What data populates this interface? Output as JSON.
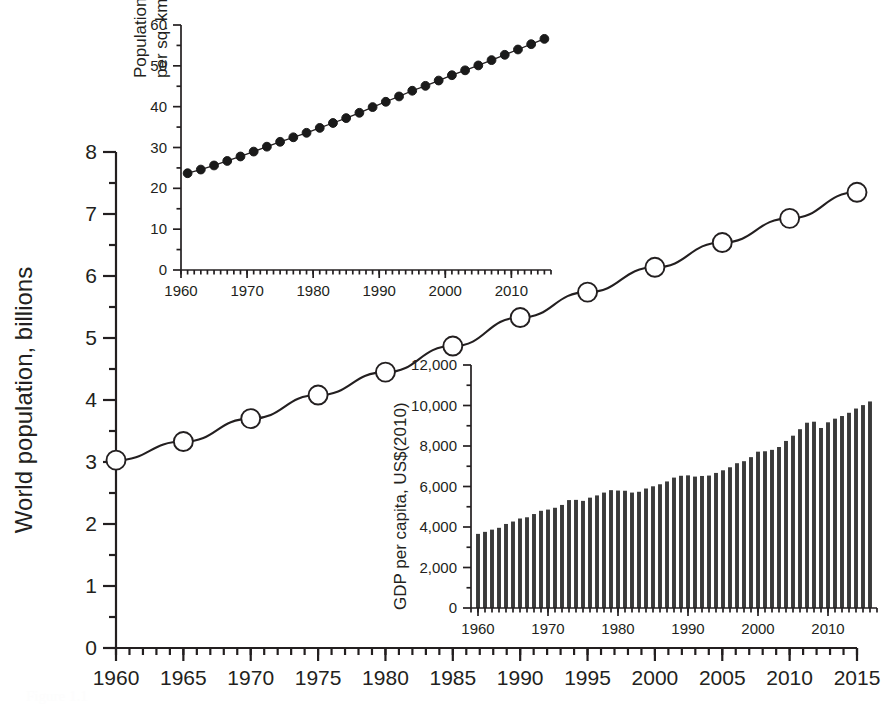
{
  "figure": {
    "background_color": "#ffffff",
    "ink_color": "#231f20",
    "width": 894,
    "height": 710,
    "caption_ghost": "Figure 1.1"
  },
  "chart_data": [
    {
      "id": "main-population",
      "type": "line",
      "title": "",
      "xlabel": "",
      "ylabel": "World population, billions",
      "xlim": [
        1960,
        2015
      ],
      "ylim": [
        0,
        8
      ],
      "grid": false,
      "legend": "none",
      "marker": "open-circle",
      "xticks": [
        1960,
        1965,
        1970,
        1975,
        1980,
        1985,
        1990,
        1995,
        2000,
        2005,
        2010,
        2015
      ],
      "xticklabels": [
        "1960",
        "1965",
        "1970",
        "1975",
        "1980",
        "1985",
        "1990",
        "1995",
        "2000",
        "2005",
        "2010",
        "2015"
      ],
      "yticks": [
        0,
        1,
        2,
        3,
        4,
        5,
        6,
        7,
        8
      ],
      "yticklabels": [
        "0",
        "1",
        "2",
        "3",
        "4",
        "5",
        "6",
        "7",
        "8"
      ],
      "x_minor_per_major": 5,
      "y_minor_per_major": 2,
      "x": [
        1960,
        1965,
        1970,
        1975,
        1980,
        1985,
        1990,
        1995,
        2000,
        2005,
        2010,
        2015
      ],
      "values": [
        3.03,
        3.33,
        3.7,
        4.08,
        4.45,
        4.87,
        5.33,
        5.74,
        6.14,
        6.54,
        6.93,
        7.35
      ]
    },
    {
      "id": "inset-population-density",
      "type": "line",
      "title": "",
      "xlabel": "",
      "ylabel": "Population density (people per sq. km of land area)",
      "xlim": [
        1960,
        2016
      ],
      "ylim": [
        0,
        60
      ],
      "grid": false,
      "legend": "none",
      "marker": "filled-circle",
      "xticks": [
        1960,
        1970,
        1980,
        1990,
        2000,
        2010
      ],
      "xticklabels": [
        "1960",
        "1970",
        "1980",
        "1990",
        "2000",
        "2010"
      ],
      "yticks": [
        0,
        10,
        20,
        30,
        40,
        50,
        60
      ],
      "yticklabels": [
        "0",
        "10",
        "20",
        "30",
        "40",
        "50",
        "60"
      ],
      "x_minor_per_major": 10,
      "y_minor_per_major": 2,
      "x": [
        1961,
        1963,
        1965,
        1967,
        1969,
        1971,
        1973,
        1975,
        1977,
        1979,
        1981,
        1983,
        1985,
        1987,
        1989,
        1991,
        1993,
        1995,
        1997,
        1999,
        2001,
        2003,
        2005,
        2007,
        2009,
        2011,
        2013,
        2015
      ],
      "values": [
        23.7,
        24.6,
        25.6,
        26.7,
        27.8,
        29.0,
        30.2,
        31.4,
        32.5,
        33.6,
        34.8,
        36.0,
        37.2,
        38.5,
        39.9,
        41.2,
        42.5,
        43.9,
        45.1,
        46.4,
        47.7,
        48.9,
        50.1,
        51.4,
        52.7,
        54.0,
        55.3,
        56.6
      ]
    },
    {
      "id": "inset-gdp-per-capita",
      "type": "bar",
      "title": "",
      "xlabel": "",
      "ylabel": "GDP per capita, US$(2010)",
      "xlim": [
        1959,
        2017
      ],
      "ylim": [
        0,
        12000
      ],
      "grid": false,
      "legend": "none",
      "xticks": [
        1960,
        1970,
        1980,
        1990,
        2000,
        2010
      ],
      "xticklabels": [
        "1960",
        "1970",
        "1980",
        "1990",
        "2000",
        "2010"
      ],
      "yticks": [
        0,
        2000,
        4000,
        6000,
        8000,
        10000,
        12000
      ],
      "yticklabels": [
        "0",
        "2,000",
        "4,000",
        "6,000",
        "8,000",
        "10,000",
        "12,000"
      ],
      "x_minor_per_major": 10,
      "y_minor_per_major": 2,
      "categories": [
        1960,
        1961,
        1962,
        1963,
        1964,
        1965,
        1966,
        1967,
        1968,
        1969,
        1970,
        1971,
        1972,
        1973,
        1974,
        1975,
        1976,
        1977,
        1978,
        1979,
        1980,
        1981,
        1982,
        1983,
        1984,
        1985,
        1986,
        1987,
        1988,
        1989,
        1990,
        1991,
        1992,
        1993,
        1994,
        1995,
        1996,
        1997,
        1998,
        1999,
        2000,
        2001,
        2002,
        2003,
        2004,
        2005,
        2006,
        2007,
        2008,
        2009,
        2010,
        2011,
        2012,
        2013,
        2014,
        2015,
        2016
      ],
      "values": [
        3660,
        3760,
        3870,
        3960,
        4150,
        4270,
        4420,
        4480,
        4640,
        4800,
        4860,
        4950,
        5090,
        5330,
        5340,
        5290,
        5450,
        5560,
        5700,
        5820,
        5800,
        5790,
        5700,
        5740,
        5900,
        6010,
        6110,
        6250,
        6440,
        6530,
        6550,
        6490,
        6520,
        6540,
        6670,
        6800,
        6950,
        7150,
        7250,
        7450,
        7720,
        7740,
        7810,
        7950,
        8250,
        8510,
        8830,
        9150,
        9200,
        8890,
        9170,
        9350,
        9480,
        9640,
        9850,
        10020,
        10200
      ]
    }
  ]
}
